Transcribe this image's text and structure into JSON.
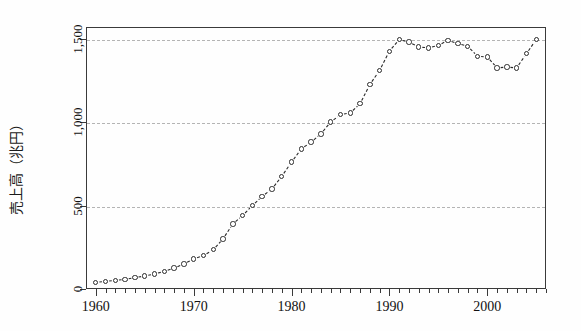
{
  "chart_data": {
    "type": "line",
    "title": "",
    "xlabel": "",
    "ylabel": "売上高（兆円）",
    "ylabel_parts": [
      "売上高",
      "（兆円）"
    ],
    "xlim": [
      1959,
      2006
    ],
    "ylim": [
      0,
      1570
    ],
    "grid": true,
    "gridlines": [
      500,
      1000,
      1500
    ],
    "legend": "none",
    "marker": "open-circle",
    "line_style": "dashed",
    "line_color": "#2a2a2a",
    "marker_color": "#2a2a2a",
    "marker_fill": "#ffffff",
    "grid_color": "#b4b4b4",
    "axis_color": "#3a3a3a",
    "yticks": [
      0,
      500,
      1000,
      1500
    ],
    "ytick_labels": [
      "0",
      "500",
      "1,000",
      "1,500"
    ],
    "xticks": [
      1960,
      1970,
      1980,
      1990,
      2000
    ],
    "xtick_labels": [
      "1960",
      "1970",
      "1980",
      "1990",
      "2000"
    ],
    "x_minor_tick_interval": 1,
    "x": [
      1960,
      1961,
      1962,
      1963,
      1964,
      1965,
      1966,
      1967,
      1968,
      1969,
      1970,
      1971,
      1972,
      1973,
      1974,
      1975,
      1976,
      1977,
      1978,
      1979,
      1980,
      1981,
      1982,
      1983,
      1984,
      1985,
      1986,
      1987,
      1988,
      1989,
      1990,
      1991,
      1992,
      1993,
      1994,
      1995,
      1996,
      1997,
      1998,
      1999,
      2000,
      2001,
      2002,
      2003,
      2004,
      2005
    ],
    "values": [
      40,
      45,
      52,
      58,
      68,
      78,
      90,
      105,
      125,
      150,
      180,
      200,
      235,
      300,
      390,
      440,
      500,
      555,
      600,
      675,
      760,
      840,
      880,
      930,
      1000,
      1045,
      1055,
      1110,
      1225,
      1310,
      1425,
      1495,
      1480,
      1450,
      1445,
      1460,
      1490,
      1470,
      1455,
      1395,
      1390,
      1325,
      1330,
      1325,
      1410,
      1495
    ],
    "units": "兆円",
    "series": [
      {
        "name": "売上高",
        "values": [
          40,
          45,
          52,
          58,
          68,
          78,
          90,
          105,
          125,
          150,
          180,
          200,
          235,
          300,
          390,
          440,
          500,
          555,
          600,
          675,
          760,
          840,
          880,
          930,
          1000,
          1045,
          1055,
          1110,
          1225,
          1310,
          1425,
          1495,
          1480,
          1450,
          1445,
          1460,
          1490,
          1470,
          1455,
          1395,
          1390,
          1325,
          1330,
          1325,
          1410,
          1495
        ]
      }
    ]
  }
}
